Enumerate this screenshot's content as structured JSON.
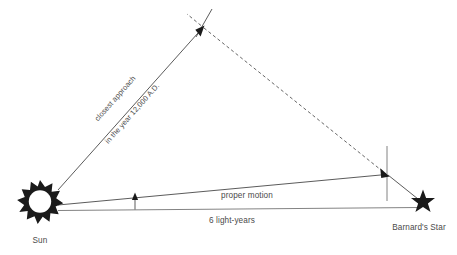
{
  "diagram": {
    "type": "astronomy-geometry-diagram",
    "background_color": "#ffffff",
    "line_color": "#3d3d3d",
    "text_color": "#4a4a4a",
    "nodes": {
      "sun": {
        "label": "Sun",
        "icon": "sun-burst-icon",
        "x": 40,
        "y": 205
      },
      "barnards_star": {
        "label": "Barnard's Star",
        "icon": "five-point-star-icon",
        "x": 423,
        "y": 202
      },
      "apex": {
        "label": "",
        "x": 203,
        "y": 27
      },
      "closest_point": {
        "label": "",
        "x": 387,
        "y": 174
      }
    },
    "labels": {
      "closest_approach_line1": "closest approach",
      "closest_approach_line2": "in the year 12,000 A.D.",
      "proper_motion": "proper motion",
      "distance": "6 light-years",
      "sun": "Sun",
      "barnards_star": "Barnard's Star"
    }
  }
}
